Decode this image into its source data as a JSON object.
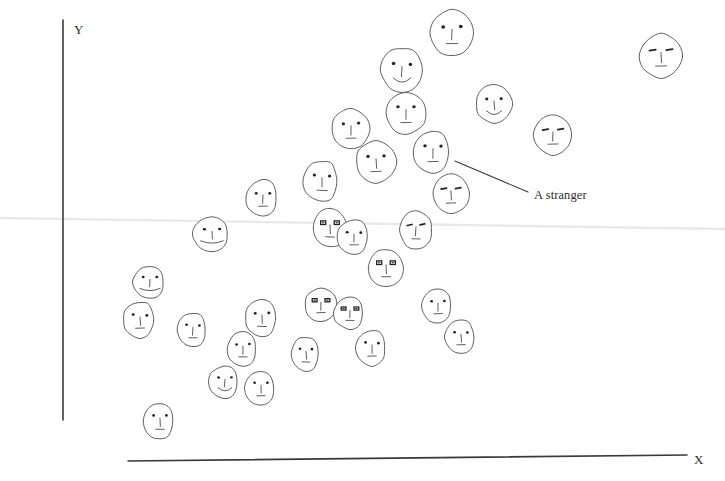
{
  "figure": {
    "background_color": "#ffffff",
    "ink_color": "#555555",
    "axis_color": "#3a3a3a",
    "trendline_color": "#e8e8e8",
    "annotation_color": "#2d2d2d",
    "width": 725,
    "height": 481
  },
  "axes": {
    "y_label": "Y",
    "x_label": "X",
    "y_axis": {
      "x1": 63,
      "y1": 20,
      "x2": 63,
      "y2": 420
    },
    "x_axis": {
      "x1": 128,
      "y1": 461,
      "x2": 687,
      "y2": 455
    }
  },
  "trendline": {
    "name": "faint-horizontal-trend-line",
    "x1": 0,
    "y1": 218,
    "x2": 725,
    "y2": 229,
    "color": "#e9e9e9",
    "width": 2.4
  },
  "annotation": {
    "text": "A stranger",
    "leader_line": {
      "x1": 455,
      "y1": 161,
      "x2": 528,
      "y2": 192
    },
    "points_to": {
      "x": 433,
      "y": 152
    }
  },
  "chart_data": {
    "type": "scatter",
    "title": "",
    "xlabel": "X",
    "ylabel": "Y",
    "grid": false,
    "legend": null,
    "marker": "hand-drawn face glyph",
    "points": [
      {
        "id": 1,
        "x": 452,
        "y": 33,
        "rx": 22,
        "ry": 23,
        "shape": "round",
        "eyes": "dot",
        "mouth": "flat",
        "nose": true,
        "stranger": false
      },
      {
        "id": 2,
        "x": 661,
        "y": 56,
        "rx": 21,
        "ry": 22,
        "shape": "round",
        "eyes": "slit",
        "mouth": "flat",
        "nose": true,
        "stranger": false
      },
      {
        "id": 3,
        "x": 402,
        "y": 70,
        "rx": 21,
        "ry": 22,
        "shape": "round",
        "eyes": "dot",
        "mouth": "smile",
        "nose": true,
        "stranger": false
      },
      {
        "id": 4,
        "x": 406,
        "y": 113,
        "rx": 20,
        "ry": 21,
        "shape": "round",
        "eyes": "dot",
        "mouth": "flat",
        "nose": true,
        "stranger": false
      },
      {
        "id": 5,
        "x": 494,
        "y": 104,
        "rx": 18,
        "ry": 19,
        "shape": "round",
        "eyes": "dot",
        "mouth": "smile",
        "nose": true,
        "stranger": false
      },
      {
        "id": 6,
        "x": 351,
        "y": 129,
        "rx": 19,
        "ry": 20,
        "shape": "round",
        "eyes": "dot",
        "mouth": "flat",
        "nose": true,
        "stranger": false
      },
      {
        "id": 7,
        "x": 553,
        "y": 135,
        "rx": 19,
        "ry": 20,
        "shape": "round",
        "eyes": "slit",
        "mouth": "flat",
        "nose": true,
        "stranger": false
      },
      {
        "id": 8,
        "x": 376,
        "y": 162,
        "rx": 20,
        "ry": 21,
        "shape": "round",
        "eyes": "dot",
        "mouth": "flat",
        "nose": true,
        "stranger": false
      },
      {
        "id": 9,
        "x": 433,
        "y": 152,
        "rx": 20,
        "ry": 21,
        "shape": "blob",
        "eyes": "dot",
        "mouth": "flat",
        "nose": true,
        "stranger": true
      },
      {
        "id": 10,
        "x": 322,
        "y": 181,
        "rx": 19,
        "ry": 20,
        "shape": "blob",
        "eyes": "dot",
        "mouth": "flat",
        "nose": true,
        "stranger": false
      },
      {
        "id": 11,
        "x": 263,
        "y": 198,
        "rx": 17,
        "ry": 18,
        "shape": "blob",
        "eyes": "dot",
        "mouth": "flat",
        "nose": true,
        "stranger": false
      },
      {
        "id": 12,
        "x": 451,
        "y": 194,
        "rx": 18,
        "ry": 20,
        "shape": "round",
        "eyes": "slit",
        "mouth": "flat",
        "nose": true,
        "stranger": false
      },
      {
        "id": 13,
        "x": 212,
        "y": 234,
        "rx": 19,
        "ry": 17,
        "shape": "blob",
        "eyes": "dot",
        "mouth": "wide",
        "nose": true,
        "stranger": false
      },
      {
        "id": 14,
        "x": 330,
        "y": 228,
        "rx": 17,
        "ry": 19,
        "shape": "round",
        "eyes": "box",
        "mouth": "flat",
        "nose": true,
        "stranger": false
      },
      {
        "id": 15,
        "x": 354,
        "y": 237,
        "rx": 17,
        "ry": 17,
        "shape": "blob",
        "eyes": "dot",
        "mouth": "flat",
        "nose": true,
        "stranger": false
      },
      {
        "id": 16,
        "x": 416,
        "y": 230,
        "rx": 16,
        "ry": 19,
        "shape": "round",
        "eyes": "slit",
        "mouth": "flat",
        "nose": true,
        "stranger": false
      },
      {
        "id": 17,
        "x": 386,
        "y": 268,
        "rx": 17,
        "ry": 19,
        "shape": "round",
        "eyes": "box",
        "mouth": "flat",
        "nose": true,
        "stranger": false
      },
      {
        "id": 18,
        "x": 150,
        "y": 282,
        "rx": 17,
        "ry": 16,
        "shape": "blob",
        "eyes": "dot",
        "mouth": "wide",
        "nose": true,
        "stranger": false
      },
      {
        "id": 19,
        "x": 140,
        "y": 320,
        "rx": 17,
        "ry": 18,
        "shape": "blob",
        "eyes": "dot",
        "mouth": "flat",
        "nose": true,
        "stranger": false
      },
      {
        "id": 20,
        "x": 193,
        "y": 330,
        "rx": 16,
        "ry": 17,
        "shape": "blob",
        "eyes": "dot",
        "mouth": "flat",
        "nose": true,
        "stranger": false
      },
      {
        "id": 21,
        "x": 262,
        "y": 318,
        "rx": 17,
        "ry": 18,
        "shape": "blob",
        "eyes": "dot",
        "mouth": "flat",
        "nose": true,
        "stranger": false
      },
      {
        "id": 22,
        "x": 243,
        "y": 349,
        "rx": 16,
        "ry": 17,
        "shape": "blob",
        "eyes": "dot",
        "mouth": "flat",
        "nose": true,
        "stranger": false
      },
      {
        "id": 23,
        "x": 225,
        "y": 382,
        "rx": 16,
        "ry": 16,
        "shape": "blob",
        "eyes": "dot",
        "mouth": "smile",
        "nose": true,
        "stranger": false
      },
      {
        "id": 24,
        "x": 261,
        "y": 388,
        "rx": 16,
        "ry": 17,
        "shape": "blob",
        "eyes": "dot",
        "mouth": "flat",
        "nose": true,
        "stranger": false
      },
      {
        "id": 25,
        "x": 160,
        "y": 421,
        "rx": 16,
        "ry": 18,
        "shape": "blob",
        "eyes": "dot",
        "mouth": "flat",
        "nose": true,
        "stranger": false
      },
      {
        "id": 26,
        "x": 306,
        "y": 354,
        "rx": 15,
        "ry": 17,
        "shape": "blob",
        "eyes": "dot",
        "mouth": "flat",
        "nose": true,
        "stranger": false
      },
      {
        "id": 27,
        "x": 321,
        "y": 305,
        "rx": 16,
        "ry": 17,
        "shape": "round",
        "eyes": "box",
        "mouth": "flat",
        "nose": true,
        "stranger": false
      },
      {
        "id": 28,
        "x": 350,
        "y": 313,
        "rx": 16,
        "ry": 16,
        "shape": "blob",
        "eyes": "box",
        "mouth": "flat",
        "nose": true,
        "stranger": false
      },
      {
        "id": 29,
        "x": 372,
        "y": 348,
        "rx": 16,
        "ry": 18,
        "shape": "blob",
        "eyes": "dot",
        "mouth": "flat",
        "nose": true,
        "stranger": false
      },
      {
        "id": 30,
        "x": 438,
        "y": 306,
        "rx": 16,
        "ry": 17,
        "shape": "blob",
        "eyes": "dot",
        "mouth": "flat",
        "nose": true,
        "stranger": false
      },
      {
        "id": 31,
        "x": 461,
        "y": 337,
        "rx": 16,
        "ry": 17,
        "shape": "blob",
        "eyes": "dot",
        "mouth": "flat",
        "nose": true,
        "stranger": false
      }
    ]
  }
}
